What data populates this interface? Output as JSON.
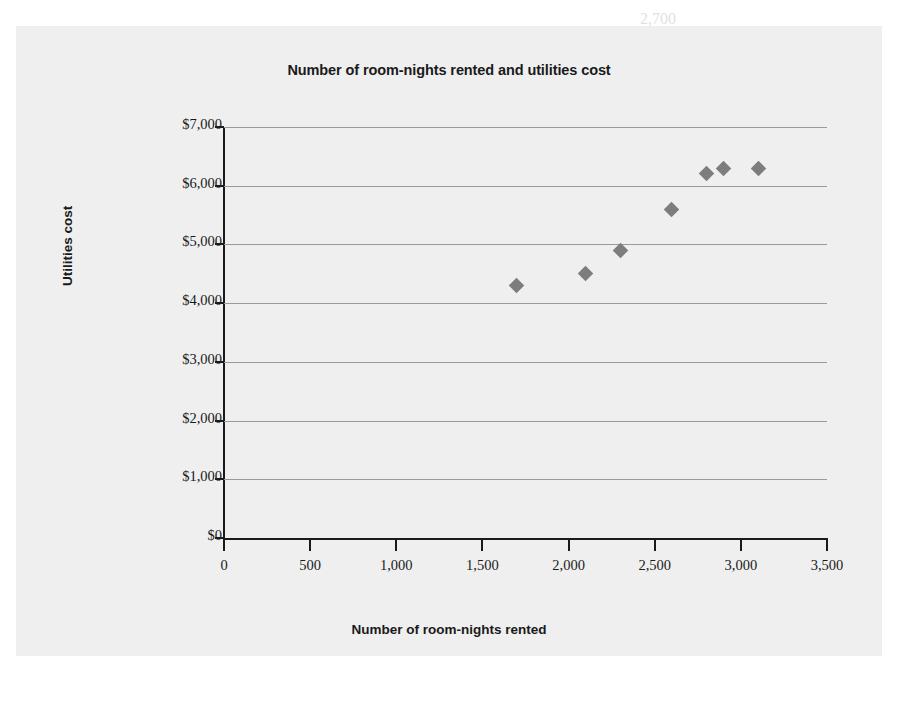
{
  "panel": {
    "background_color": "#efefef"
  },
  "chart_data": {
    "type": "scatter",
    "title": "Number of room-nights rented and utilities cost",
    "xlabel": "Number of room-nights rented",
    "ylabel": "Utilities cost",
    "xlim": [
      0,
      3500
    ],
    "ylim": [
      0,
      7000
    ],
    "grid": true,
    "legend": null,
    "marker": "diamond",
    "marker_color": "#7d7d7d",
    "xticks": [
      0,
      500,
      1000,
      1500,
      2000,
      2500,
      3000,
      3500
    ],
    "xtick_labels": [
      "0",
      "500",
      "1,000",
      "1,500",
      "2,000",
      "2,500",
      "3,000",
      "3,500"
    ],
    "yticks": [
      0,
      1000,
      2000,
      3000,
      4000,
      5000,
      6000,
      7000
    ],
    "ytick_labels": [
      "$0",
      "$1,000",
      "$2,000",
      "$3,000",
      "$4,000",
      "$5,000",
      "$6,000",
      "$7,000"
    ],
    "points": [
      {
        "x": 1700,
        "y": 4300
      },
      {
        "x": 2100,
        "y": 4500
      },
      {
        "x": 2300,
        "y": 4900
      },
      {
        "x": 2600,
        "y": 5600
      },
      {
        "x": 2800,
        "y": 6200
      },
      {
        "x": 2900,
        "y": 6300
      },
      {
        "x": 3100,
        "y": 6300
      }
    ]
  },
  "background_text": [
    {
      "text": "2,700",
      "left": 640,
      "top": 10,
      "size": 16
    },
    {
      "text": "  6. Identify",
      "left": 596,
      "top": 34,
      "size": 16
    },
    {
      "text": "a. Using the above information, you must create a table that shows the",
      "left": 330,
      "top": 64,
      "size": 16
    },
    {
      "text": "variable cost, total fixed cost, and total cost for each of the months.",
      "left": 358,
      "top": 88,
      "size": 16
    },
    {
      "text": "b. Utility cost behavior (Learning Objective 2)",
      "left": 330,
      "top": 112,
      "size": 17
    },
    {
      "text": "c. The total cost of operating the hotel in a month in which",
      "left": 358,
      "top": 136,
      "size": 16
    },
    {
      "text": "service department costs are allocated to the operating",
      "left": 358,
      "top": 160,
      "size": 16
    },
    {
      "text": "d. An estimate of the cost if the hotel rents 2,750 room-nights",
      "left": 330,
      "top": 184,
      "size": 16
    },
    {
      "text": "Requirements",
      "left": 596,
      "top": 214,
      "size": 16
    },
    {
      "text": "1. Identify the cost as fixed, variable, or mixed",
      "left": 330,
      "top": 238,
      "size": 16
    },
    {
      "text": "2. Explain",
      "left": 596,
      "top": 262,
      "size": 16
    },
    {
      "text": "3. What is the total cost of operating",
      "left": 358,
      "top": 330,
      "size": 16
    },
    {
      "text": "E6-21A  Predict costs (Learning Objective 3)",
      "left": 330,
      "top": 452,
      "size": 17
    },
    {
      "text": "Sunset Inn",
      "left": 596,
      "top": 476,
      "size": 16
    },
    {
      "text": "management estimates the following costs for the coming year",
      "left": 358,
      "top": 500,
      "size": 16
    },
    {
      "text": "at the hotel. The manager believes that utilities cost will",
      "left": 330,
      "top": 524,
      "size": 16
    }
  ]
}
